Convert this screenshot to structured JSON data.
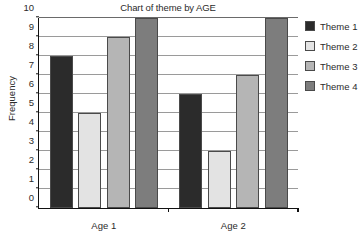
{
  "chart_data": {
    "type": "bar",
    "title": "Chart of theme by AGE",
    "xlabel": "",
    "ylabel": "Frequency",
    "ylim": [
      0,
      10
    ],
    "yticks": [
      0,
      1,
      2,
      3,
      4,
      5,
      6,
      7,
      8,
      9,
      10
    ],
    "ytick_labels": [
      "0",
      "1",
      "2",
      "3",
      "4",
      "5",
      "6",
      "7",
      "8",
      "9",
      "10"
    ],
    "grid": true,
    "grid_axis": "y",
    "legend_position": "right",
    "categories": [
      "Age 1",
      "Age 2"
    ],
    "series": [
      {
        "name": "Theme 1",
        "color": "#2b2b2b",
        "values": [
          8,
          6
        ]
      },
      {
        "name": "Theme 2",
        "color": "#e3e3e3",
        "values": [
          5,
          3
        ]
      },
      {
        "name": "Theme 3",
        "color": "#b5b5b5",
        "values": [
          9,
          7
        ]
      },
      {
        "name": "Theme 4",
        "color": "#7d7d7d",
        "values": [
          10,
          10
        ]
      }
    ]
  },
  "legend": {
    "entries": [
      {
        "label": "Theme 1",
        "color": "#2b2b2b"
      },
      {
        "label": "Theme 2",
        "color": "#e3e3e3"
      },
      {
        "label": "Theme 3",
        "color": "#b5b5b5"
      },
      {
        "label": "Theme 4",
        "color": "#7d7d7d"
      }
    ]
  }
}
